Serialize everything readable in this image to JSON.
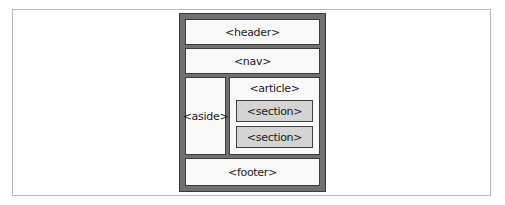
{
  "diagram": {
    "elements": {
      "header": "<header>",
      "nav": "<nav>",
      "aside": "<aside>",
      "article": "<article>",
      "sections": [
        "<section>",
        "<section>"
      ],
      "footer": "<footer>"
    },
    "colors": {
      "frame": "#707070",
      "box_fill": "#f9f9f9",
      "section_fill": "#d4d4d4",
      "border": "#3c3c3c"
    }
  }
}
